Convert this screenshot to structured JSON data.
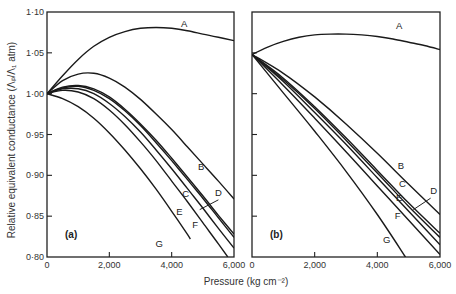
{
  "chart_data": [
    {
      "type": "line",
      "panel_label": "(a)",
      "xlabel": "Pressure (kg cm⁻²)",
      "ylabel": "Relative equivalent conductance (Λₚ/Λ₁ atm)",
      "xlim": [
        0,
        6000
      ],
      "ylim": [
        0.8,
        1.1
      ],
      "x_ticks": [
        0,
        2000,
        4000,
        6000
      ],
      "x_tick_labels": [
        "0",
        "2,000",
        "4,000",
        "6,000"
      ],
      "y_ticks": [
        0.8,
        0.85,
        0.9,
        0.95,
        1.0,
        1.05,
        1.1
      ],
      "y_tick_labels": [
        "0·80",
        "0·85",
        "0·90",
        "0·95",
        "1·00",
        "1·05",
        "1·10"
      ],
      "grid": false,
      "series": [
        {
          "name": "A",
          "x": [
            0,
            500,
            1000,
            1500,
            2000,
            2500,
            3000,
            3500,
            4000,
            4500,
            5000,
            5500,
            6000
          ],
          "y": [
            1.0,
            1.022,
            1.042,
            1.058,
            1.069,
            1.076,
            1.08,
            1.081,
            1.08,
            1.077,
            1.073,
            1.069,
            1.065
          ]
        },
        {
          "name": "B",
          "x": [
            0,
            500,
            1000,
            1500,
            2000,
            2500,
            3000,
            3500,
            4000,
            4500,
            5000,
            5500,
            6000
          ],
          "y": [
            1.0,
            1.016,
            1.024,
            1.025,
            1.019,
            1.008,
            0.993,
            0.975,
            0.956,
            0.935,
            0.914,
            0.893,
            0.871
          ]
        },
        {
          "name": "C",
          "x": [
            0,
            500,
            1000,
            1500,
            2000,
            2500,
            3000,
            3500,
            4000,
            4500,
            5000,
            5500,
            6000
          ],
          "y": [
            1.0,
            1.008,
            1.01,
            1.006,
            0.996,
            0.981,
            0.963,
            0.943,
            0.921,
            0.898,
            0.875,
            0.851,
            0.828
          ]
        },
        {
          "name": "D",
          "x": [
            0,
            500,
            1000,
            1500,
            2000,
            2500,
            3000,
            3500,
            4000,
            4500,
            5000,
            5500,
            6000
          ],
          "y": [
            1.0,
            1.007,
            1.009,
            1.004,
            0.994,
            0.979,
            0.961,
            0.94,
            0.918,
            0.895,
            0.872,
            0.848,
            0.824
          ]
        },
        {
          "name": "E",
          "x": [
            0,
            500,
            1000,
            1500,
            2000,
            2500,
            3000,
            3500,
            4000,
            4500,
            5000,
            5500,
            6000
          ],
          "y": [
            1.0,
            1.006,
            1.006,
            1.0,
            0.988,
            0.972,
            0.953,
            0.931,
            0.908,
            0.884,
            0.86,
            0.835,
            0.811
          ]
        },
        {
          "name": "F",
          "x": [
            0,
            500,
            1000,
            1500,
            2000,
            2500,
            3000,
            3500,
            4000,
            4500,
            5000,
            5500,
            5800
          ],
          "y": [
            1.0,
            1.004,
            1.002,
            0.994,
            0.98,
            0.962,
            0.941,
            0.918,
            0.893,
            0.868,
            0.842,
            0.816,
            0.8
          ]
        },
        {
          "name": "G",
          "x": [
            0,
            500,
            1000,
            1500,
            2000,
            2500,
            3000,
            3500,
            4000,
            4500,
            4600
          ],
          "y": [
            1.0,
            0.994,
            0.984,
            0.97,
            0.952,
            0.931,
            0.908,
            0.883,
            0.856,
            0.828,
            0.822
          ]
        }
      ]
    },
    {
      "type": "line",
      "panel_label": "(b)",
      "xlabel": "Pressure (kg cm⁻²)",
      "xlim": [
        0,
        6000
      ],
      "ylim": [
        0.8,
        1.1
      ],
      "x_ticks": [
        0,
        2000,
        4000,
        6000
      ],
      "x_tick_labels": [
        "0",
        "2,000",
        "4,000",
        "6,000"
      ],
      "grid": false,
      "series": [
        {
          "name": "A",
          "x": [
            0,
            500,
            1000,
            1500,
            2000,
            2500,
            3000,
            3500,
            4000,
            4500,
            5000,
            5500,
            6000
          ],
          "y": [
            1.048,
            1.057,
            1.064,
            1.069,
            1.072,
            1.073,
            1.073,
            1.072,
            1.07,
            1.067,
            1.063,
            1.059,
            1.054
          ]
        },
        {
          "name": "B",
          "x": [
            0,
            1000,
            2000,
            3000,
            4000,
            5000,
            6000
          ],
          "y": [
            1.048,
            1.025,
            0.996,
            0.963,
            0.927,
            0.889,
            0.852
          ]
        },
        {
          "name": "C",
          "x": [
            0,
            1000,
            2000,
            3000,
            4000,
            5000,
            6000
          ],
          "y": [
            1.048,
            1.019,
            0.984,
            0.946,
            0.906,
            0.866,
            0.829
          ]
        },
        {
          "name": "D",
          "x": [
            0,
            1000,
            2000,
            3000,
            4000,
            5000,
            6000
          ],
          "y": [
            1.048,
            1.017,
            0.982,
            0.943,
            0.903,
            0.862,
            0.824
          ]
        },
        {
          "name": "E",
          "x": [
            0,
            1000,
            2000,
            3000,
            4000,
            5000,
            6000
          ],
          "y": [
            1.048,
            1.015,
            0.977,
            0.938,
            0.897,
            0.856,
            0.815
          ]
        },
        {
          "name": "F",
          "x": [
            0,
            1000,
            2000,
            3000,
            4000,
            5000,
            6000
          ],
          "y": [
            1.048,
            1.01,
            0.97,
            0.929,
            0.887,
            0.845,
            0.803
          ]
        },
        {
          "name": "G",
          "x": [
            0,
            1000,
            2000,
            3000,
            4000,
            4900
          ],
          "y": [
            1.048,
            1.001,
            0.954,
            0.905,
            0.852,
            0.8
          ]
        }
      ]
    }
  ],
  "labels": {
    "y_axis_title": "Relative equivalent conductance (Λₚ/Λ₁ atm)",
    "x_axis_title": "Pressure (kg cm⁻²)",
    "panel_a": "(a)",
    "panel_b": "(b)"
  },
  "curve_label_positions": {
    "a": {
      "A": [
        4400,
        1.082
      ],
      "B": [
        4950,
        0.907
      ],
      "C": [
        4450,
        0.873
      ],
      "D": [
        5500,
        0.875
      ],
      "E": [
        4250,
        0.852
      ],
      "F": [
        4750,
        0.836
      ],
      "G": [
        3600,
        0.812
      ]
    },
    "b": {
      "A": [
        4700,
        1.079
      ],
      "B": [
        4750,
        0.908
      ],
      "C": [
        4800,
        0.886
      ],
      "D": [
        5800,
        0.877
      ],
      "E": [
        4700,
        0.869
      ],
      "F": [
        4650,
        0.847
      ],
      "G": [
        4300,
        0.817
      ]
    }
  },
  "d_leader": {
    "a": [
      [
        4900,
        0.858
      ],
      [
        5500,
        0.87
      ]
    ],
    "b": [
      [
        5150,
        0.858
      ],
      [
        5700,
        0.872
      ]
    ]
  }
}
